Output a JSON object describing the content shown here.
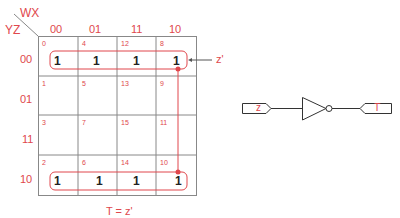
{
  "kmap": {
    "row_var": "YZ",
    "col_var": "WX",
    "col_labels": [
      "00",
      "01",
      "11",
      "10"
    ],
    "row_labels": [
      "00",
      "01",
      "11",
      "10"
    ],
    "cell_indices": [
      [
        "0",
        "4",
        "12",
        "8"
      ],
      [
        "1",
        "5",
        "13",
        "9"
      ],
      [
        "3",
        "7",
        "15",
        "11"
      ],
      [
        "2",
        "6",
        "14",
        "10"
      ]
    ],
    "cell_values": [
      [
        "1",
        "1",
        "1",
        "1"
      ],
      [
        "",
        "",
        "",
        ""
      ],
      [
        "",
        "",
        "",
        ""
      ],
      [
        "1",
        "1",
        "1",
        "1"
      ]
    ],
    "group_label": "z'",
    "equation": "T = z'",
    "accent_color": "#e0474c",
    "grid_color": "#888888"
  },
  "circuit": {
    "input_label": "z",
    "output_label": "T",
    "gate": "NOT"
  }
}
